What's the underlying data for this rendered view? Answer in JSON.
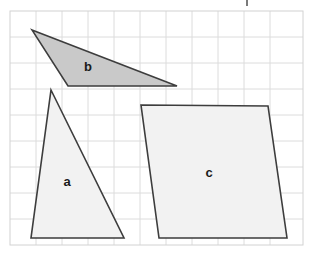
{
  "figure": {
    "title": "Geometric shapes on a square grid",
    "width": 312,
    "height": 267,
    "background_color": "#ffffff"
  },
  "grid": {
    "name": "square-grid",
    "x": 10,
    "y": 11,
    "width": 293,
    "height": 234,
    "cell_size": 26,
    "columns": 11,
    "rows": 9,
    "line_color": "#dcdcdc",
    "border_color": "#d2d2d2",
    "visible": true
  },
  "shapes": [
    {
      "id": "a",
      "name": "triangle-a",
      "type": "triangle",
      "label": "a",
      "label_x": 67,
      "label_y": 183,
      "fill": "#f2f2f2",
      "stroke": "#3d3d3d",
      "stroke_width": 1.6,
      "points": "51,90 124,238 31,238",
      "vertices": [
        [
          51,
          90
        ],
        [
          124,
          238
        ],
        [
          31,
          238
        ]
      ]
    },
    {
      "id": "b",
      "name": "triangle-b",
      "type": "triangle",
      "label": "b",
      "label_x": 88,
      "label_y": 68,
      "fill": "#c9c9c9",
      "stroke": "#3d3d3d",
      "stroke_width": 1.6,
      "points": "32,30 177,86 68,86",
      "vertices": [
        [
          32,
          30
        ],
        [
          177,
          86
        ],
        [
          68,
          86
        ]
      ]
    },
    {
      "id": "c",
      "name": "quadrilateral-c",
      "type": "quadrilateral",
      "label": "c",
      "label_x": 209,
      "label_y": 174,
      "fill": "#f2f2f2",
      "stroke": "#3d3d3d",
      "stroke_width": 1.6,
      "points": "141,105 268,106 287,238 159,238",
      "vertices": [
        [
          141,
          105
        ],
        [
          268,
          106
        ],
        [
          287,
          238
        ],
        [
          159,
          238
        ]
      ]
    }
  ],
  "marks": [
    {
      "name": "stray-mark",
      "x": 246,
      "y": 0,
      "width": 2,
      "height": 6,
      "color": "#7a7a7a"
    }
  ]
}
